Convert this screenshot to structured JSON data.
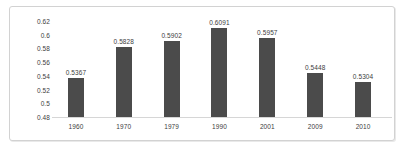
{
  "chart_data": {
    "type": "bar",
    "title": "",
    "subtitle": "",
    "xlabel": "",
    "ylabel": "",
    "categories": [
      "1960",
      "1970",
      "1979",
      "1990",
      "2001",
      "2009",
      "2010"
    ],
    "values": [
      0.5367,
      0.5828,
      0.5902,
      0.6091,
      0.5957,
      0.5448,
      0.5304
    ],
    "data_labels": [
      "0.5367",
      "0.5828",
      "0.5902",
      "0.6091",
      "0.5957",
      "0.5448",
      "0.5304"
    ],
    "ylim": [
      0.48,
      0.62
    ],
    "y_ticks": [
      0.48,
      0.5,
      0.52,
      0.54,
      0.56,
      0.58,
      0.6,
      0.62
    ],
    "y_tick_labels": [
      "0.48",
      "0.5",
      "0.52",
      "0.54",
      "0.56",
      "0.58",
      "0.6",
      "0.62"
    ],
    "grid": false,
    "legend": false,
    "legend_position": "none",
    "series": [
      {
        "name": "",
        "values": [
          0.5367,
          0.5828,
          0.5902,
          0.6091,
          0.5957,
          0.5448,
          0.5304
        ]
      }
    ],
    "colors": {
      "bar": "#4b4b4b",
      "axis_line": "#d6d6d6",
      "text": "#3d3d3d",
      "frame_border": "#d2d2d2",
      "background": "#ffffff"
    }
  }
}
